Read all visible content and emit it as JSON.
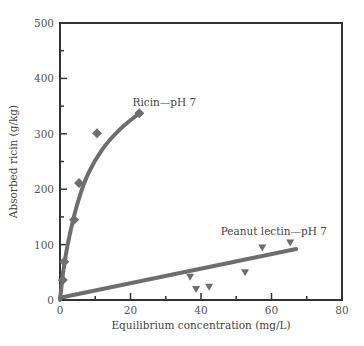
{
  "chart_data": {
    "type": "scatter",
    "title": "",
    "xlabel": "Equilibrium concentration (mg/L)",
    "ylabel": "Absorbed ricin (g/kg)",
    "xlim": [
      0,
      80
    ],
    "ylim": [
      0,
      500
    ],
    "xticks": [
      0,
      20,
      40,
      60,
      80
    ],
    "xminor": [
      10,
      30,
      50,
      70
    ],
    "yticks": [
      0,
      100,
      200,
      300,
      400,
      500
    ],
    "yminor": [
      50,
      150,
      250,
      350,
      450
    ],
    "grid": false,
    "legend": "none (inline annotations)",
    "series": [
      {
        "name": "Ricin—pH 7",
        "marker": "diamond",
        "points": [
          {
            "x": 0.8,
            "y": 36
          },
          {
            "x": 1.2,
            "y": 69
          },
          {
            "x": 4.0,
            "y": 145
          },
          {
            "x": 5.4,
            "y": 211
          },
          {
            "x": 10.5,
            "y": 301
          },
          {
            "x": 22.5,
            "y": 337
          }
        ],
        "fit": {
          "type": "curve (Langmuir-like)",
          "points": [
            {
              "x": 0,
              "y": 0
            },
            {
              "x": 1,
              "y": 55
            },
            {
              "x": 2.5,
              "y": 110
            },
            {
              "x": 5,
              "y": 175
            },
            {
              "x": 8,
              "y": 228
            },
            {
              "x": 12,
              "y": 272
            },
            {
              "x": 17,
              "y": 308
            },
            {
              "x": 22.5,
              "y": 337
            }
          ]
        }
      },
      {
        "name": "Peanut lectin—pH 7",
        "marker": "triangle-down",
        "points": [
          {
            "x": 36.9,
            "y": 41
          },
          {
            "x": 38.6,
            "y": 19
          },
          {
            "x": 42.3,
            "y": 23
          },
          {
            "x": 52.5,
            "y": 49
          },
          {
            "x": 57.4,
            "y": 94
          },
          {
            "x": 65.3,
            "y": 103
          }
        ],
        "fit": {
          "type": "linear",
          "points": [
            {
              "x": 0,
              "y": 4
            },
            {
              "x": 67,
              "y": 92
            }
          ]
        }
      }
    ],
    "annotations": [
      {
        "text": "Ricin—pH 7",
        "x": 20,
        "y": 355
      },
      {
        "text": "Peanut lectin—pH 7",
        "x": 45,
        "y": 125
      }
    ]
  },
  "colors": {
    "axis": "#333333",
    "series": "#6e6e6e",
    "text": "#444444"
  }
}
